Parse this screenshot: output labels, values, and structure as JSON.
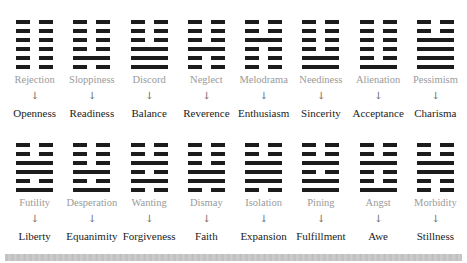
{
  "rows": [
    {
      "items": [
        {
          "from": "Rejection",
          "to": "Openness",
          "lines": [
            "broken",
            "broken",
            "broken",
            "broken",
            "broken",
            "broken"
          ]
        },
        {
          "from": "Sloppiness",
          "to": "Readiness",
          "lines": [
            "broken",
            "broken",
            "broken",
            "broken",
            "solid",
            "broken"
          ]
        },
        {
          "from": "Discord",
          "to": "Balance",
          "lines": [
            "broken",
            "broken",
            "broken",
            "solid",
            "solid",
            "solid"
          ]
        },
        {
          "from": "Neglect",
          "to": "Reverence",
          "lines": [
            "broken",
            "broken",
            "broken",
            "solid",
            "broken",
            "broken"
          ]
        },
        {
          "from": "Melodrama",
          "to": "Enthusiasm",
          "lines": [
            "broken",
            "broken",
            "solid",
            "broken",
            "broken",
            "broken"
          ]
        },
        {
          "from": "Neediness",
          "to": "Sincerity",
          "lines": [
            "broken",
            "broken",
            "broken",
            "broken",
            "solid",
            "solid"
          ]
        },
        {
          "from": "Alienation",
          "to": "Acceptance",
          "lines": [
            "broken",
            "broken",
            "broken",
            "broken",
            "broken",
            "solid"
          ]
        },
        {
          "from": "Pessimism",
          "to": "Charisma",
          "lines": [
            "broken",
            "broken",
            "solid",
            "solid",
            "solid",
            "solid"
          ]
        }
      ]
    },
    {
      "items": [
        {
          "from": "Futility",
          "to": "Liberty",
          "lines": [
            "broken",
            "broken",
            "solid",
            "solid",
            "broken",
            "solid"
          ]
        },
        {
          "from": "Desperation",
          "to": "Equanimity",
          "lines": [
            "broken",
            "broken",
            "broken",
            "solid",
            "broken",
            "solid"
          ]
        },
        {
          "from": "Wanting",
          "to": "Forgiveness",
          "lines": [
            "broken",
            "broken",
            "solid",
            "broken",
            "solid",
            "broken"
          ]
        },
        {
          "from": "Dismay",
          "to": "Faith",
          "lines": [
            "broken",
            "broken",
            "broken",
            "solid",
            "solid",
            "broken"
          ]
        },
        {
          "from": "Isolation",
          "to": "Expansion",
          "lines": [
            "broken",
            "broken",
            "solid",
            "solid",
            "solid",
            "broken"
          ]
        },
        {
          "from": "Pining",
          "to": "Fulfillment",
          "lines": [
            "broken",
            "broken",
            "solid",
            "broken",
            "solid",
            "solid"
          ]
        },
        {
          "from": "Angst",
          "to": "Awe",
          "lines": [
            "broken",
            "broken",
            "solid",
            "broken",
            "broken",
            "solid"
          ]
        },
        {
          "from": "Morbidity",
          "to": "Stillness",
          "lines": [
            "broken",
            "broken",
            "solid",
            "solid",
            "broken",
            "broken"
          ]
        }
      ]
    }
  ],
  "arrow_glyph": "↓",
  "colors": {
    "line": "#1c1c1c",
    "from_text": "#9a9a9a",
    "to_text": "#222222"
  }
}
